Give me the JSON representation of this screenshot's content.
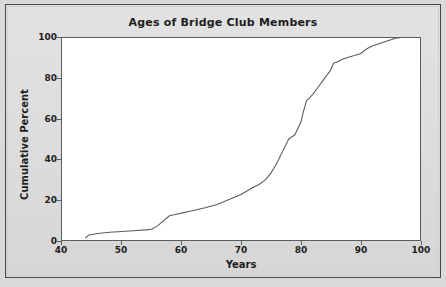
{
  "chart_data": {
    "type": "line",
    "title": "Ages of Bridge Club Members",
    "xlabel": "Years",
    "ylabel": "Cumulative Percent",
    "xlim": [
      40,
      100
    ],
    "ylim": [
      0,
      100
    ],
    "xticks": [
      40,
      50,
      60,
      70,
      80,
      90,
      100
    ],
    "yticks": [
      0,
      20,
      40,
      60,
      80,
      100
    ],
    "grid": false,
    "legend": null,
    "series": [
      {
        "name": "Cumulative Percent",
        "x": [
          44,
          44.5,
          46,
          48,
          50,
          52,
          54,
          55,
          56,
          57,
          58,
          59,
          60,
          62,
          64,
          66,
          68,
          70,
          72,
          73,
          74,
          75,
          76,
          77,
          78,
          79,
          80,
          80.5,
          81,
          82,
          83,
          84,
          85,
          85.5,
          86,
          87,
          88,
          89,
          90,
          91,
          92,
          93,
          94,
          95,
          96,
          96.5
        ],
        "y": [
          1,
          2.5,
          3.2,
          3.8,
          4.2,
          4.6,
          5,
          5.3,
          7,
          9.5,
          12,
          12.6,
          13.3,
          14.6,
          16,
          17.6,
          20,
          22.5,
          26,
          27.5,
          29.5,
          33,
          38,
          44,
          50,
          52,
          58,
          64,
          69,
          72,
          76,
          80,
          84,
          87.5,
          88,
          89.5,
          90.5,
          91.3,
          92.2,
          94.5,
          96,
          97,
          98,
          99,
          100,
          100
        ]
      }
    ]
  },
  "axes": {
    "y_ticks_labels": [
      "100",
      "80",
      "60",
      "40",
      "20",
      "0"
    ],
    "x_ticks_labels": [
      "40",
      "50",
      "60",
      "70",
      "80",
      "90",
      "100"
    ]
  },
  "colors": {
    "line": "#5a5a66",
    "frame": "#5a5d60",
    "background": "#dcdcdc",
    "plot_background": "#ffffff",
    "text": "#1d1d1d"
  }
}
